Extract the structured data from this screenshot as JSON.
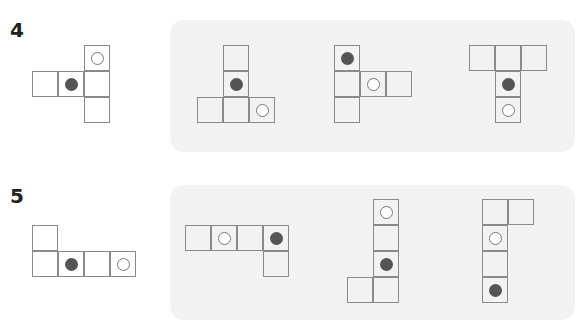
{
  "colors": {
    "panel_bg": "#f2f2f2",
    "grid_line": "#8a8a8a",
    "filled_dot": "#555555",
    "open_dot_stroke": "#777777"
  },
  "problems": [
    {
      "number": "4",
      "question_net": {
        "cells": [
          {
            "x": 84,
            "y": 45,
            "mark": "open"
          },
          {
            "x": 32,
            "y": 71,
            "mark": null
          },
          {
            "x": 58,
            "y": 71,
            "mark": "filled"
          },
          {
            "x": 84,
            "y": 71,
            "mark": null
          },
          {
            "x": 84,
            "y": 97,
            "mark": null
          }
        ]
      },
      "options_panel": {
        "x": 170,
        "y": 20,
        "w": 405,
        "h": 132
      },
      "options": [
        {
          "cells": [
            {
              "x": 223,
              "y": 45,
              "mark": null
            },
            {
              "x": 223,
              "y": 71,
              "mark": "filled"
            },
            {
              "x": 197,
              "y": 97,
              "mark": null
            },
            {
              "x": 223,
              "y": 97,
              "mark": null
            },
            {
              "x": 249,
              "y": 97,
              "mark": "open"
            }
          ]
        },
        {
          "cells": [
            {
              "x": 334,
              "y": 45,
              "mark": "filled"
            },
            {
              "x": 334,
              "y": 71,
              "mark": null
            },
            {
              "x": 360,
              "y": 71,
              "mark": "open"
            },
            {
              "x": 386,
              "y": 71,
              "mark": null
            },
            {
              "x": 334,
              "y": 97,
              "mark": null
            }
          ]
        },
        {
          "cells": [
            {
              "x": 469,
              "y": 45,
              "mark": null
            },
            {
              "x": 495,
              "y": 45,
              "mark": null
            },
            {
              "x": 521,
              "y": 45,
              "mark": null
            },
            {
              "x": 495,
              "y": 71,
              "mark": "filled"
            },
            {
              "x": 495,
              "y": 97,
              "mark": "open"
            }
          ]
        }
      ]
    },
    {
      "number": "5",
      "question_net": {
        "cells": [
          {
            "x": 32,
            "y": 225,
            "mark": null
          },
          {
            "x": 32,
            "y": 251,
            "mark": null
          },
          {
            "x": 58,
            "y": 251,
            "mark": "filled"
          },
          {
            "x": 84,
            "y": 251,
            "mark": null
          },
          {
            "x": 110,
            "y": 251,
            "mark": "open"
          }
        ]
      },
      "options_panel": {
        "x": 170,
        "y": 185,
        "w": 405,
        "h": 135
      },
      "options": [
        {
          "cells": [
            {
              "x": 185,
              "y": 225,
              "mark": null
            },
            {
              "x": 211,
              "y": 225,
              "mark": "open"
            },
            {
              "x": 237,
              "y": 225,
              "mark": null
            },
            {
              "x": 263,
              "y": 225,
              "mark": "filled"
            },
            {
              "x": 263,
              "y": 251,
              "mark": null
            }
          ]
        },
        {
          "cells": [
            {
              "x": 373,
              "y": 199,
              "mark": "open"
            },
            {
              "x": 373,
              "y": 225,
              "mark": null
            },
            {
              "x": 373,
              "y": 251,
              "mark": "filled"
            },
            {
              "x": 347,
              "y": 277,
              "mark": null
            },
            {
              "x": 373,
              "y": 277,
              "mark": null
            }
          ]
        },
        {
          "cells": [
            {
              "x": 482,
              "y": 199,
              "mark": null
            },
            {
              "x": 508,
              "y": 199,
              "mark": null
            },
            {
              "x": 482,
              "y": 225,
              "mark": "open"
            },
            {
              "x": 482,
              "y": 251,
              "mark": null
            },
            {
              "x": 482,
              "y": 277,
              "mark": "filled"
            }
          ]
        }
      ]
    }
  ]
}
